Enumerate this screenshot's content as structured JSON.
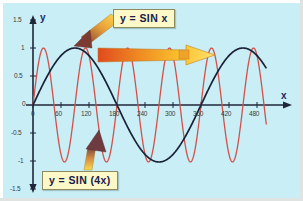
{
  "figure": {
    "background_color": "#c9eef5",
    "border_color": "#ffffff"
  },
  "axes": {
    "x_axis_name": "x",
    "y_axis_name": "y",
    "axis_color": "#20263a",
    "x_ticks": [
      "0",
      "60",
      "120",
      "180",
      "240",
      "300",
      "360",
      "420",
      "480"
    ],
    "y_ticks": [
      "1.5",
      "1",
      "0.5",
      "0",
      "-0.5",
      "-1",
      "-1.5"
    ]
  },
  "callouts": {
    "sin_x": "y = SIN x",
    "sin_4x": "y = SIN (4x)"
  },
  "annotations": {
    "arrow_to_sinx_curve": "arrow-pointing-down-left",
    "arrow_horizontal": "arrow-pointing-right",
    "arrow_to_sin4x_curve": "arrow-pointing-up"
  },
  "chart_data": {
    "type": "line",
    "title": "",
    "xlabel": "x",
    "ylabel": "y",
    "xlim": [
      0,
      500
    ],
    "ylim": [
      -1.5,
      1.5
    ],
    "grid": false,
    "x_ticks": [
      0,
      60,
      120,
      180,
      240,
      300,
      360,
      420,
      480
    ],
    "y_ticks": [
      -1.5,
      -1,
      -0.5,
      0,
      0.5,
      1,
      1.5
    ],
    "x_unit": "degrees",
    "legend": [
      "y = SIN x",
      "y = SIN (4x)"
    ],
    "legend_position": "callout-labels",
    "series": [
      {
        "name": "y = SIN x",
        "color": "#1a2238",
        "expression": "sin(x)",
        "amplitude": 1,
        "period_degrees": 360,
        "x": [
          0,
          20,
          40,
          60,
          80,
          100,
          120,
          140,
          160,
          180,
          200,
          220,
          240,
          260,
          280,
          300,
          320,
          340,
          360,
          380,
          400,
          420,
          440,
          460,
          480,
          500
        ],
        "values": [
          0,
          0.342,
          0.643,
          0.866,
          0.985,
          0.985,
          0.866,
          0.643,
          0.342,
          0,
          -0.342,
          -0.643,
          -0.866,
          -0.985,
          -0.985,
          -0.866,
          -0.643,
          -0.342,
          0,
          0.342,
          0.643,
          0.866,
          0.985,
          0.985,
          0.866,
          0.643
        ]
      },
      {
        "name": "y = SIN (4x)",
        "color": "#d2514b",
        "expression": "sin(4x)",
        "amplitude": 1,
        "period_degrees": 90,
        "x": [
          0,
          10,
          20,
          30,
          40,
          50,
          60,
          70,
          80,
          90,
          100,
          110,
          120,
          130,
          140,
          150,
          160,
          170,
          180,
          190,
          200,
          210,
          220,
          230,
          240,
          250,
          260,
          270,
          280,
          290,
          300,
          310,
          320,
          330,
          340,
          350,
          360,
          370,
          380,
          390,
          400,
          410,
          420,
          430,
          440,
          450,
          460,
          470,
          480,
          490,
          500
        ],
        "values": [
          0,
          0.643,
          0.985,
          0.866,
          0.342,
          -0.342,
          -0.866,
          -0.985,
          -0.643,
          0,
          0.643,
          0.985,
          0.866,
          0.342,
          -0.342,
          -0.866,
          -0.985,
          -0.643,
          0,
          0.643,
          0.985,
          0.866,
          0.342,
          -0.342,
          -0.866,
          -0.985,
          -0.643,
          0,
          0.643,
          0.985,
          0.866,
          0.342,
          -0.342,
          -0.866,
          -0.985,
          -0.643,
          0,
          0.643,
          0.985,
          0.866,
          0.342,
          -0.342,
          -0.866,
          -0.985,
          -0.643,
          0,
          0.643,
          0.985,
          0.866,
          0.342,
          -0.342
        ]
      }
    ]
  }
}
